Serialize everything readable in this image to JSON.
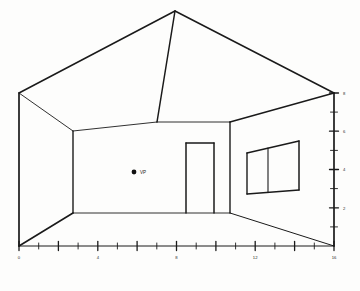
{
  "figure": {
    "background_color": "#fdfdfc",
    "line_color": "#1a1a1a"
  },
  "axes": {
    "x_axis": {
      "label_values": [
        "0",
        "4",
        "8",
        "12",
        "16"
      ],
      "major_ticks": [
        0,
        2,
        4,
        6,
        8,
        10,
        12,
        14,
        16
      ],
      "minor_ticks": [
        1,
        3,
        5,
        7,
        9,
        11,
        13,
        15
      ],
      "range": [
        0,
        16
      ],
      "origin_px": [
        19,
        246
      ],
      "end_px": [
        334,
        246
      ]
    },
    "y_axis": {
      "label_values": [
        "2",
        "4",
        "6",
        "8"
      ],
      "major_ticks": [
        2,
        4,
        6,
        8
      ],
      "minor_ticks": [
        1,
        3,
        5,
        7
      ],
      "range": [
        0,
        8
      ],
      "origin_px": [
        334,
        246
      ],
      "end_px": [
        334,
        93
      ]
    }
  },
  "annotations": {
    "vanishing_point": {
      "label": "VP",
      "x_px": 134,
      "y_px": 172,
      "dot_radius": 2.4
    }
  },
  "room": {
    "ceiling_apex_px": [
      175,
      11
    ],
    "left_ceiling_corner_px": [
      19,
      93
    ],
    "right_ceiling_corner_px": [
      334,
      93
    ],
    "back_wall_left_top_px": [
      73,
      131
    ],
    "back_wall_right_top_px": [
      230,
      122
    ],
    "back_wall_left_bottom_px": [
      73,
      213
    ],
    "back_wall_right_bottom_px": [
      230,
      213
    ],
    "floor_left_front_px": [
      19,
      246
    ],
    "floor_right_front_px": [
      334,
      246
    ]
  },
  "door": {
    "name": "door",
    "top_left_px": [
      186,
      143
    ],
    "top_right_px": [
      214,
      143
    ],
    "bottom_left_px": [
      186,
      213
    ],
    "bottom_right_px": [
      214,
      213
    ]
  },
  "window": {
    "name": "window",
    "has_mullion": true,
    "top_left_px": [
      247,
      153
    ],
    "top_right_px": [
      299,
      141
    ],
    "bottom_left_px": [
      247,
      194
    ],
    "bottom_right_px": [
      299,
      190
    ],
    "mullion_top_px": [
      268,
      148
    ],
    "mullion_bottom_px": [
      268,
      192
    ]
  }
}
